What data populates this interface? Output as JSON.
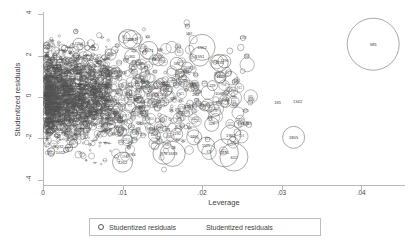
{
  "chart_data": {
    "type": "scatter",
    "title": "",
    "subtitle": "",
    "xlabel": "Leverage",
    "ylabel": "Studentized residuals",
    "xlim": [
      0,
      0.0455
    ],
    "ylim": [
      -4.3,
      4.3
    ],
    "xticks": [
      0,
      0.01,
      0.02,
      0.03,
      0.04
    ],
    "xtick_labels": [
      "0",
      ".01",
      ".02",
      ".03",
      ".04"
    ],
    "yticks": [
      4,
      2,
      0,
      -2,
      -4
    ],
    "ytick_labels": [
      "4",
      "2",
      "0",
      "-2",
      "-4"
    ],
    "grid": false,
    "legend_position": "bottom-center",
    "legend_entries": [
      {
        "marker": "open-circle",
        "label": "Studentized residuals"
      },
      {
        "marker": "none",
        "label": "Studentized residuals"
      }
    ],
    "marker_encoding": "bubble size proportional to Cook's distance; each bubble annotated with observation id",
    "labeled_points": [
      {
        "id": "585",
        "x": 0.0415,
        "y": 2.55,
        "r": 26.0
      },
      {
        "id": "1805",
        "x": 0.0315,
        "y": -1.95,
        "r": 11.0
      },
      {
        "id": "181",
        "x": 0.0295,
        "y": -0.25,
        "r": 0.0
      },
      {
        "id": "1342",
        "x": 0.032,
        "y": -0.2,
        "r": 0.0
      },
      {
        "id": "1562",
        "x": 0.02,
        "y": 2.4,
        "r": 13.0
      },
      {
        "id": "1551",
        "x": 0.0197,
        "y": 1.95,
        "r": 9.5
      },
      {
        "id": "1234",
        "x": 0.0222,
        "y": 1.65,
        "r": 8.5
      },
      {
        "id": "1290",
        "x": 0.0228,
        "y": 1.72,
        "r": 6.5
      },
      {
        "id": "1129",
        "x": 0.0107,
        "y": 2.8,
        "r": 9.5
      },
      {
        "id": "1282",
        "x": 0.0112,
        "y": 2.78,
        "r": 9.0
      },
      {
        "id": "1571",
        "x": 0.0133,
        "y": 2.25,
        "r": 9.0
      },
      {
        "id": "365",
        "x": 0.0112,
        "y": 1.95,
        "r": 7.5
      },
      {
        "id": "1254",
        "x": 0.0045,
        "y": 2.55,
        "r": 6.0
      },
      {
        "id": "1487",
        "x": 0.0085,
        "y": 2.05,
        "r": 5.5
      },
      {
        "id": "583",
        "x": 0.0168,
        "y": 1.6,
        "r": 6.5
      },
      {
        "id": "1503",
        "x": 0.0181,
        "y": 1.42,
        "r": 5.5
      },
      {
        "id": "1539",
        "x": 0.0145,
        "y": 1.8,
        "r": 6.0
      },
      {
        "id": "1465",
        "x": 0.0223,
        "y": 0.95,
        "r": 5.5
      },
      {
        "id": "239",
        "x": 0.0213,
        "y": 0.55,
        "r": 5.0
      },
      {
        "id": "1045",
        "x": 0.0222,
        "y": 0.18,
        "r": 0.0
      },
      {
        "id": "1260",
        "x": 0.0228,
        "y": -0.1,
        "r": 0.0
      },
      {
        "id": "282",
        "x": 0.0192,
        "y": 0.12,
        "r": 0.0
      },
      {
        "id": "1223",
        "x": 0.0183,
        "y": -0.45,
        "r": 0.0
      },
      {
        "id": "528",
        "x": 0.0212,
        "y": -1.32,
        "r": 7.0
      },
      {
        "id": "1903",
        "x": 0.0236,
        "y": -1.85,
        "r": 10.0
      },
      {
        "id": "1691",
        "x": 0.0228,
        "y": -2.7,
        "r": 14.0
      },
      {
        "id": "612",
        "x": 0.024,
        "y": -2.9,
        "r": 14.0
      },
      {
        "id": "1525",
        "x": 0.0205,
        "y": -2.35,
        "r": 8.5
      },
      {
        "id": "1696",
        "x": 0.019,
        "y": -1.95,
        "r": 7.5
      },
      {
        "id": "1683",
        "x": 0.0163,
        "y": -2.75,
        "r": 12.5
      },
      {
        "id": "876",
        "x": 0.0152,
        "y": -2.72,
        "r": 11.0
      },
      {
        "id": "1202",
        "x": 0.01,
        "y": -3.15,
        "r": 10.0
      },
      {
        "id": "1508",
        "x": 0.014,
        "y": -1.85,
        "r": 6.0
      },
      {
        "id": "1190",
        "x": 0.0168,
        "y": -1.8,
        "r": 6.0
      },
      {
        "id": "1012",
        "x": 0.0022,
        "y": -2.7,
        "r": 0.0
      },
      {
        "id": "1032",
        "x": 0.002,
        "y": -2.4,
        "r": 0.0
      },
      {
        "id": "828",
        "x": 0.0018,
        "y": -1.85,
        "r": 0.0
      }
    ]
  }
}
